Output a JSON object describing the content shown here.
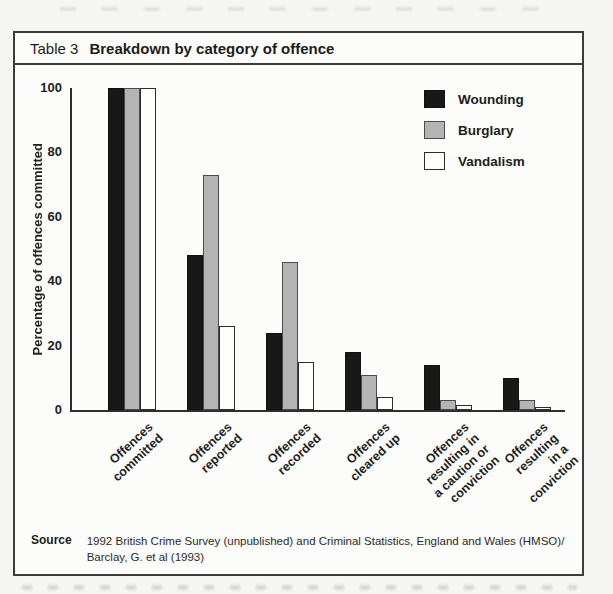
{
  "header": {
    "table_label": "Table 3",
    "title": "Breakdown by category of offence"
  },
  "source": {
    "label": "Source",
    "line1": "1992 British Crime Survey (unpublished) and Criminal Statistics, England and Wales (HMSO)/",
    "line2": "Barclay, G. et al (1993)"
  },
  "chart_data": {
    "type": "bar",
    "title": "Breakdown by category of offence",
    "xlabel": "",
    "ylabel": "Percentage of offences committed",
    "ylim": [
      0,
      100
    ],
    "yticks": [
      0,
      20,
      40,
      60,
      80,
      100
    ],
    "grid": false,
    "legend_position": "top-right",
    "categories": [
      "Offences committed",
      "Offences reported",
      "Offences recorded",
      "Offences cleared up",
      "Offences resulting in a caution or conviction",
      "Offences resulting in a conviction"
    ],
    "category_lines": [
      [
        "Offences",
        "committed"
      ],
      [
        "Offences",
        "reported"
      ],
      [
        "Offences",
        "recorded"
      ],
      [
        "Offences",
        "cleared up"
      ],
      [
        "Offences resulting in",
        "a caution or conviction"
      ],
      [
        "Offences resulting",
        "in a conviction"
      ]
    ],
    "series": [
      {
        "name": "Wounding",
        "color": "#181818",
        "values": [
          100,
          48,
          24,
          18,
          14,
          10
        ]
      },
      {
        "name": "Burglary",
        "color": "#b4b4b4",
        "values": [
          100,
          73,
          46,
          11,
          3,
          3
        ]
      },
      {
        "name": "Vandalism",
        "color": "#fdfdfc",
        "values": [
          100,
          26,
          15,
          4,
          1.5,
          1
        ]
      }
    ]
  }
}
